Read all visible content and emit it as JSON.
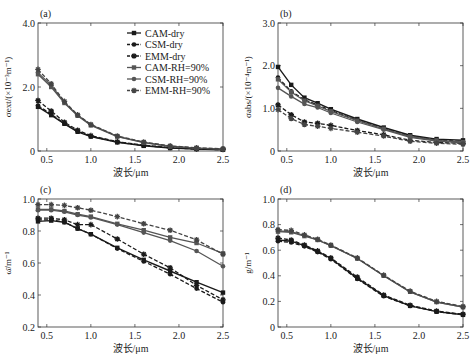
{
  "chart_data": [
    {
      "type": "line",
      "panel": "(a)",
      "ylabel": "σext/(×10⁻³m⁻¹)",
      "xlabel": "波长/μm",
      "xlim": [
        0.4,
        2.5
      ],
      "ylim": [
        0,
        4.0
      ],
      "xticks": [
        "0.5",
        "1.0",
        "1.5",
        "2.0",
        "2.5"
      ],
      "xtick_values": [
        0.5,
        1.0,
        1.5,
        2.0,
        2.5
      ],
      "yticks": [
        "0",
        "2.0",
        "4.0"
      ],
      "ytick_values": [
        0,
        2.0,
        4.0
      ],
      "legend": "top-right",
      "x": [
        0.4,
        0.55,
        0.7,
        0.85,
        1.0,
        1.3,
        1.6,
        1.9,
        2.2,
        2.5
      ],
      "series": [
        {
          "name": "CAM-dry",
          "values": [
            1.38,
            1.12,
            0.85,
            0.6,
            0.45,
            0.27,
            0.16,
            0.09,
            0.06,
            0.04
          ]
        },
        {
          "name": "CSM-dry",
          "values": [
            1.42,
            1.15,
            0.86,
            0.62,
            0.46,
            0.28,
            0.17,
            0.1,
            0.06,
            0.04
          ]
        },
        {
          "name": "EMM-dry",
          "values": [
            1.58,
            1.25,
            0.9,
            0.65,
            0.48,
            0.29,
            0.18,
            0.11,
            0.07,
            0.05
          ]
        },
        {
          "name": "CAM-RH=90%",
          "values": [
            2.4,
            2.0,
            1.5,
            1.1,
            0.8,
            0.45,
            0.26,
            0.14,
            0.09,
            0.06
          ]
        },
        {
          "name": "CSM-RH=90%",
          "values": [
            2.45,
            2.05,
            1.52,
            1.12,
            0.82,
            0.46,
            0.27,
            0.15,
            0.09,
            0.06
          ]
        },
        {
          "name": "EMM-RH=90%",
          "values": [
            2.55,
            2.1,
            1.55,
            1.13,
            0.83,
            0.47,
            0.28,
            0.16,
            0.1,
            0.07
          ]
        }
      ]
    },
    {
      "type": "line",
      "panel": "(b)",
      "ylabel": "σabs/(×10⁻⁴m⁻¹)",
      "xlabel": "波长/μm",
      "xlim": [
        0.4,
        2.5
      ],
      "ylim": [
        0,
        3.0
      ],
      "xticks": [
        "0.5",
        "1.0",
        "1.5",
        "2.0",
        "2.5"
      ],
      "xtick_values": [
        0.5,
        1.0,
        1.5,
        2.0,
        2.5
      ],
      "yticks": [
        "0",
        "1.0",
        "2.0",
        "3.0"
      ],
      "ytick_values": [
        0,
        1.0,
        2.0,
        3.0
      ],
      "x": [
        0.4,
        0.55,
        0.7,
        0.85,
        1.0,
        1.3,
        1.6,
        1.9,
        2.2,
        2.5
      ],
      "series": [
        {
          "name": "CAM-dry",
          "values": [
            1.97,
            1.55,
            1.25,
            1.12,
            0.98,
            0.75,
            0.55,
            0.37,
            0.28,
            0.25
          ]
        },
        {
          "name": "CSM-dry",
          "values": [
            1.72,
            1.4,
            1.2,
            1.08,
            0.95,
            0.72,
            0.53,
            0.35,
            0.26,
            0.22
          ]
        },
        {
          "name": "EMM-dry",
          "values": [
            1.08,
            0.85,
            0.68,
            0.65,
            0.6,
            0.48,
            0.38,
            0.25,
            0.2,
            0.18
          ]
        },
        {
          "name": "CAM-RH=90%",
          "values": [
            1.68,
            1.38,
            1.18,
            1.06,
            0.93,
            0.71,
            0.52,
            0.34,
            0.25,
            0.21
          ]
        },
        {
          "name": "CSM-RH=90%",
          "values": [
            1.48,
            1.28,
            1.1,
            1.02,
            0.89,
            0.68,
            0.5,
            0.32,
            0.23,
            0.19
          ]
        },
        {
          "name": "EMM-RH=90%",
          "values": [
            0.97,
            0.76,
            0.62,
            0.58,
            0.53,
            0.44,
            0.35,
            0.23,
            0.18,
            0.16
          ]
        }
      ]
    },
    {
      "type": "line",
      "panel": "(c)",
      "ylabel": "ω̄/m⁻¹",
      "xlabel": "波长/μm",
      "xlim": [
        0.4,
        2.5
      ],
      "ylim": [
        0.2,
        1.0
      ],
      "xticks": [
        "0.5",
        "1.0",
        "1.5",
        "2.0",
        "2.5"
      ],
      "xtick_values": [
        0.5,
        1.0,
        1.5,
        2.0,
        2.5
      ],
      "yticks": [
        "0.2",
        "0.4",
        "0.6",
        "0.8",
        "1.0"
      ],
      "ytick_values": [
        0.2,
        0.4,
        0.6,
        0.8,
        1.0
      ],
      "x": [
        0.4,
        0.55,
        0.7,
        0.85,
        1.0,
        1.3,
        1.6,
        1.9,
        2.2,
        2.5
      ],
      "series": [
        {
          "name": "CAM-dry",
          "values": [
            0.86,
            0.865,
            0.855,
            0.815,
            0.78,
            0.695,
            0.62,
            0.55,
            0.48,
            0.415
          ]
        },
        {
          "name": "CSM-dry",
          "values": [
            0.87,
            0.87,
            0.855,
            0.815,
            0.78,
            0.69,
            0.61,
            0.53,
            0.44,
            0.355
          ]
        },
        {
          "name": "EMM-dry",
          "values": [
            0.88,
            0.88,
            0.87,
            0.84,
            0.84,
            0.75,
            0.655,
            0.57,
            0.46,
            0.37
          ]
        },
        {
          "name": "CAM-RH=90%",
          "values": [
            0.935,
            0.935,
            0.925,
            0.905,
            0.89,
            0.845,
            0.805,
            0.76,
            0.725,
            0.66
          ]
        },
        {
          "name": "CSM-RH=90%",
          "values": [
            0.93,
            0.93,
            0.92,
            0.9,
            0.885,
            0.84,
            0.79,
            0.74,
            0.675,
            0.58
          ]
        },
        {
          "name": "EMM-RH=90%",
          "values": [
            0.965,
            0.965,
            0.96,
            0.945,
            0.93,
            0.89,
            0.845,
            0.805,
            0.745,
            0.655
          ]
        }
      ]
    },
    {
      "type": "line",
      "panel": "(d)",
      "ylabel": "g/m⁻¹",
      "xlabel": "波长/μm",
      "xlim": [
        0.4,
        2.5
      ],
      "ylim": [
        0,
        1.0
      ],
      "xticks": [
        "0.5",
        "1.0",
        "1.5",
        "2.0",
        "2.5"
      ],
      "xtick_values": [
        0.5,
        1.0,
        1.5,
        2.0,
        2.5
      ],
      "yticks": [
        "0",
        "0.2",
        "0.4",
        "0.6",
        "0.8",
        "1.0"
      ],
      "ytick_values": [
        0,
        0.2,
        0.4,
        0.6,
        0.8,
        1.0
      ],
      "x": [
        0.4,
        0.55,
        0.7,
        0.85,
        1.0,
        1.3,
        1.6,
        1.9,
        2.2,
        2.5
      ],
      "series": [
        {
          "name": "CAM-dry",
          "values": [
            0.68,
            0.67,
            0.635,
            0.59,
            0.535,
            0.38,
            0.245,
            0.165,
            0.12,
            0.095
          ]
        },
        {
          "name": "CSM-dry",
          "values": [
            0.67,
            0.66,
            0.63,
            0.585,
            0.53,
            0.375,
            0.24,
            0.165,
            0.12,
            0.095
          ]
        },
        {
          "name": "EMM-dry",
          "values": [
            0.695,
            0.68,
            0.64,
            0.595,
            0.54,
            0.39,
            0.25,
            0.17,
            0.125,
            0.1
          ]
        },
        {
          "name": "CAM-RH=90%",
          "values": [
            0.745,
            0.74,
            0.71,
            0.68,
            0.635,
            0.535,
            0.4,
            0.275,
            0.195,
            0.155
          ]
        },
        {
          "name": "CSM-RH=90%",
          "values": [
            0.75,
            0.745,
            0.715,
            0.68,
            0.635,
            0.535,
            0.4,
            0.275,
            0.195,
            0.155
          ]
        },
        {
          "name": "EMM-RH=90%",
          "values": [
            0.76,
            0.755,
            0.72,
            0.685,
            0.64,
            0.54,
            0.405,
            0.28,
            0.2,
            0.16
          ]
        }
      ]
    }
  ],
  "legend": [
    {
      "name": "CAM-dry",
      "color": "#1a1a1a",
      "dash": false,
      "marker": "square"
    },
    {
      "name": "CSM-dry",
      "color": "#1a1a1a",
      "dash": true,
      "marker": "circle"
    },
    {
      "name": "EMM-dry",
      "color": "#1a1a1a",
      "dash": true,
      "marker": "star"
    },
    {
      "name": "CAM-RH=90%",
      "color": "#555555",
      "dash": false,
      "marker": "square"
    },
    {
      "name": "CSM-RH=90%",
      "color": "#555555",
      "dash": false,
      "marker": "circle"
    },
    {
      "name": "EMM-RH=90%",
      "color": "#444444",
      "dash": true,
      "marker": "star"
    }
  ]
}
